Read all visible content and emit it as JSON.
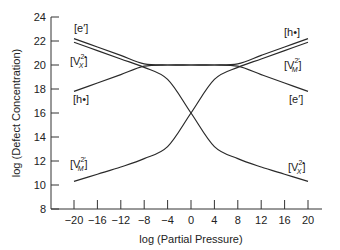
{
  "chart_data": {
    "type": "line",
    "title": "",
    "xlabel": "log (Partial Pressure)",
    "ylabel": "log (Defect Concentration)",
    "xlim": [
      -20,
      20
    ],
    "ylim": [
      8,
      24
    ],
    "xticks": [
      -20,
      -16,
      -12,
      -8,
      -4,
      0,
      4,
      8,
      12,
      16,
      20
    ],
    "xtick_labels": [
      "−20",
      "−16",
      "−12",
      "−8",
      "−4",
      "0",
      "4",
      "8",
      "12",
      "16",
      "20"
    ],
    "yticks": [
      8,
      10,
      12,
      14,
      16,
      18,
      20,
      22,
      24
    ],
    "ytick_labels": [
      "8",
      "10",
      "12",
      "14",
      "16",
      "18",
      "20",
      "22",
      "24"
    ],
    "grid": false,
    "legend": "inline labels at line ends",
    "x": [
      -20,
      -16,
      -12,
      -8,
      -4,
      0,
      4,
      8,
      12,
      16,
      20
    ],
    "series": [
      {
        "name": "[e']",
        "label_main": "[e′]",
        "values": [
          22.2,
          21.5,
          20.8,
          20.1,
          20.0,
          20.0,
          20.0,
          19.9,
          19.2,
          18.5,
          17.8
        ]
      },
      {
        "name": "[V_X^2•]",
        "label_main": "[V",
        "label_sub": "X",
        "label_sup": "2•",
        "label_close": "]",
        "values": [
          21.9,
          21.2,
          20.5,
          19.8,
          18.8,
          16.0,
          13.2,
          12.2,
          11.5,
          10.9,
          10.3
        ]
      },
      {
        "name": "[h•]",
        "label_main": "[h•]",
        "values": [
          17.8,
          18.5,
          19.2,
          19.9,
          20.0,
          20.0,
          20.0,
          20.1,
          20.8,
          21.5,
          22.2
        ]
      },
      {
        "name": "[V_M^2′]",
        "label_main": "[V",
        "label_sub": "M",
        "label_sup": "2′",
        "label_close": "]",
        "values": [
          10.3,
          10.9,
          11.5,
          12.2,
          13.2,
          16.0,
          18.8,
          19.8,
          20.5,
          21.2,
          21.9
        ]
      }
    ]
  }
}
